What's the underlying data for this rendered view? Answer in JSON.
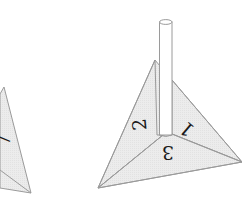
{
  "figure": {
    "faces": [
      {
        "id": "face-1",
        "label": "1"
      },
      {
        "id": "face-2",
        "label": "2"
      },
      {
        "id": "face-3",
        "label": "3"
      }
    ],
    "partial_shape": {
      "label_fragment": "7"
    },
    "colors": {
      "face_fill": "#e9e9e9",
      "edge": "#9a9a9a",
      "text": "#1a1a1a",
      "background": "#ffffff"
    }
  }
}
